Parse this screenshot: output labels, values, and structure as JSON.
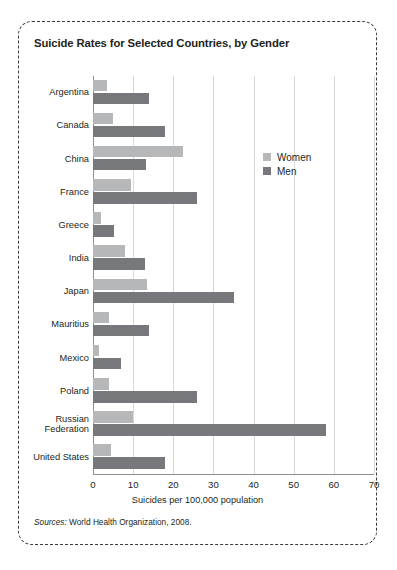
{
  "figure": {
    "title": "Suicide Rates for Selected Countries, by Gender",
    "source_lead": "Sources:",
    "source_text": " World Health Organization, 2008."
  },
  "legend": {
    "position": "inside-top-right",
    "items": [
      {
        "label": "Women",
        "color": "#b6b7b9"
      },
      {
        "label": "Men",
        "color": "#77787b"
      }
    ]
  },
  "axis": {
    "x_title": "Suicides per 100,000 population",
    "ticks": [
      "0",
      "10",
      "20",
      "30",
      "40",
      "50",
      "60",
      "70"
    ]
  },
  "chart_data": {
    "type": "bar",
    "orientation": "horizontal",
    "title": "Suicide Rates for Selected Countries, by Gender",
    "xlabel": "Suicides per 100,000 population",
    "ylabel": "",
    "xlim": [
      0,
      70
    ],
    "xticks": [
      0,
      10,
      20,
      30,
      40,
      50,
      60,
      70
    ],
    "grid": "vertical",
    "legend_position": "inside-top-right",
    "categories": [
      "Argentina",
      "Canada",
      "China",
      "France",
      "Greece",
      "India",
      "Japan",
      "Mauritius",
      "Mexico",
      "Poland",
      "Russian Federation",
      "United States"
    ],
    "series": [
      {
        "name": "Women",
        "color": "#b6b7b9",
        "values": [
          3.5,
          5,
          22.5,
          9.5,
          2,
          8,
          13.5,
          4,
          1.5,
          4,
          10,
          4.5
        ]
      },
      {
        "name": "Men",
        "color": "#77787b",
        "values": [
          14,
          18,
          13.3,
          26,
          5.3,
          13,
          35,
          14,
          7,
          26,
          58,
          18
        ]
      }
    ]
  }
}
